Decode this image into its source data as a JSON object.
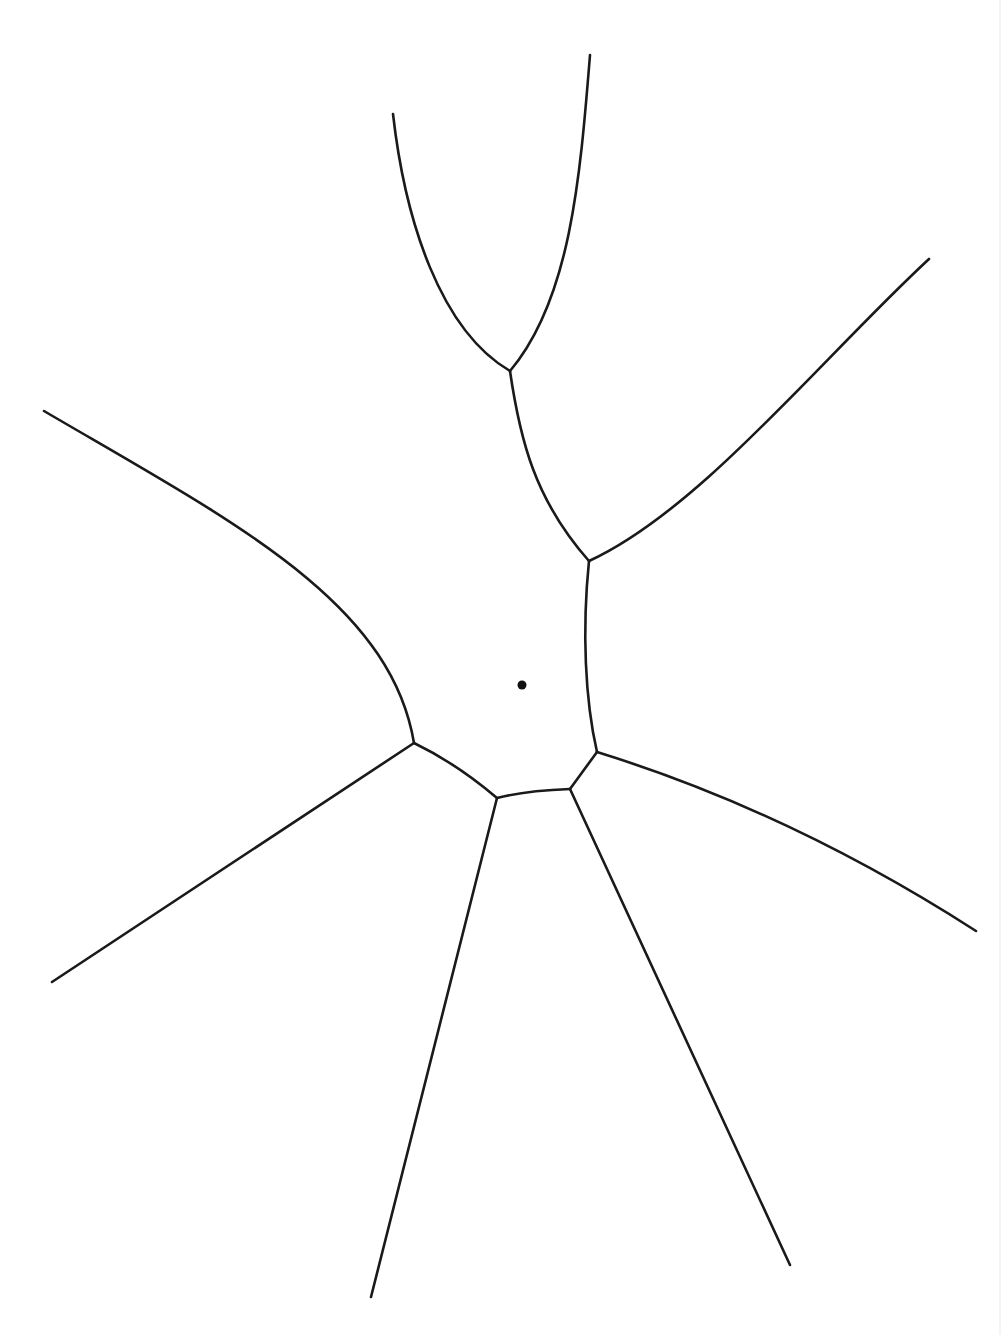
{
  "diagram": {
    "type": "voronoi-like cell boundary diagram",
    "width": 1001,
    "height": 1335,
    "stroke_color": "#1a1a1a",
    "background": "#ffffff",
    "site": {
      "x": 522,
      "y": 685,
      "r": 4.5
    },
    "vertices": [
      {
        "id": "v-top",
        "x": 510,
        "y": 371
      },
      {
        "id": "v-upper-right",
        "x": 589,
        "y": 561
      },
      {
        "id": "v-right",
        "x": 597,
        "y": 752
      },
      {
        "id": "v-bottom-right",
        "x": 570,
        "y": 789
      },
      {
        "id": "v-bottom-left",
        "x": 497,
        "y": 798
      },
      {
        "id": "v-left",
        "x": 414,
        "y": 743
      }
    ],
    "edges": [
      {
        "name": "edge-top-left-arm",
        "d": "M393,114 C405,220 440,330 510,371"
      },
      {
        "name": "edge-top-right-arm",
        "d": "M590,55 C580,180 570,300 510,371"
      },
      {
        "name": "edge-top-to-upper-right",
        "d": "M510,371 C520,440 535,500 589,561"
      },
      {
        "name": "edge-upper-right-arm",
        "d": "M589,561 C700,510 820,360 929,259"
      },
      {
        "name": "edge-upper-right-to-right",
        "d": "M589,561 C582,630 585,700 597,752"
      },
      {
        "name": "edge-right-arm",
        "d": "M597,752 C720,790 850,850 976,931"
      },
      {
        "name": "edge-right-to-bottom-right",
        "d": "M597,752 L570,789"
      },
      {
        "name": "edge-bottom-right-arm",
        "d": "M570,789 L790,1265"
      },
      {
        "name": "edge-bottom-right-to-bottom-left",
        "d": "M570,789 C545,790 520,792 497,798"
      },
      {
        "name": "edge-bottom-left-arm",
        "d": "M497,798 L371,1297"
      },
      {
        "name": "edge-bottom-left-to-left",
        "d": "M497,798 C470,775 445,758 414,743"
      },
      {
        "name": "edge-left-arm",
        "d": "M414,743 L52,982"
      },
      {
        "name": "edge-upper-left-arm",
        "d": "M44,411 C230,520 390,600 414,743"
      }
    ]
  }
}
